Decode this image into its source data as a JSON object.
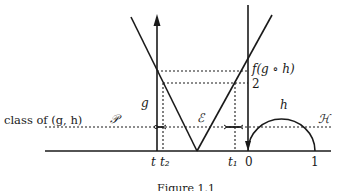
{
  "figure": {
    "caption": "Figure 1.1",
    "labels": {
      "class_of": "class of (g, h)",
      "P": "𝒫",
      "E": "ℰ",
      "H": "ℋ",
      "g": "g",
      "h": "h",
      "f_g_h": "f(g ∘ h)",
      "two": "2",
      "t": "t",
      "t2": "t₂",
      "t1": "t₁",
      "zero": "0",
      "one": "1"
    },
    "colors": {
      "ink": "#1a1a1a",
      "background": "#ffffff"
    }
  }
}
